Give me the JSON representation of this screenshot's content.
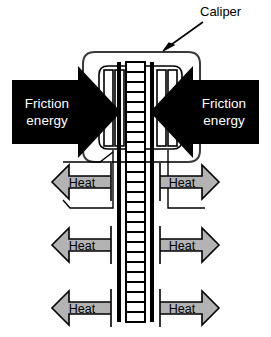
{
  "figure": {
    "background_color": "#ffffff"
  },
  "annotations": {
    "caliper": {
      "label": "Caliper",
      "leader_from": [
        201,
        22
      ],
      "leader_to": [
        163,
        49
      ],
      "text_color": "#000000"
    }
  },
  "friction_arrows": [
    {
      "id": "friction-left",
      "label_line1": "Friction",
      "label_line2": "energy",
      "direction": "right",
      "fill": "#000000",
      "text_color": "#ffffff"
    },
    {
      "id": "friction-right",
      "label_line1": "Friction",
      "label_line2": "energy",
      "direction": "left",
      "fill": "#000000",
      "text_color": "#ffffff"
    }
  ],
  "heat_arrows": [
    {
      "id": "heat-left-1",
      "label": "Heat",
      "direction": "left",
      "row": 1,
      "fill": "#b3b3b3",
      "stroke": "#000000",
      "text_color": "#000000"
    },
    {
      "id": "heat-right-1",
      "label": "Heat",
      "direction": "right",
      "row": 1,
      "fill": "#b3b3b3",
      "stroke": "#000000",
      "text_color": "#000000"
    },
    {
      "id": "heat-left-2",
      "label": "Heat",
      "direction": "left",
      "row": 2,
      "fill": "#b3b3b3",
      "stroke": "#000000",
      "text_color": "#000000"
    },
    {
      "id": "heat-right-2",
      "label": "Heat",
      "direction": "right",
      "row": 2,
      "fill": "#b3b3b3",
      "stroke": "#000000",
      "text_color": "#000000"
    },
    {
      "id": "heat-left-3",
      "label": "Heat",
      "direction": "left",
      "row": 3,
      "fill": "#b3b3b3",
      "stroke": "#000000",
      "text_color": "#000000"
    },
    {
      "id": "heat-right-3",
      "label": "Heat",
      "direction": "right",
      "row": 3,
      "fill": "#b3b3b3",
      "stroke": "#000000",
      "text_color": "#000000"
    }
  ],
  "components": {
    "rotor": {
      "name": "vented-brake-rotor",
      "fill": "#ffffff",
      "stroke": "#000000",
      "vent_count": 26
    },
    "caliper_body": {
      "name": "caliper-housing",
      "fill": "#ffffff",
      "stroke": "#333333"
    },
    "pads": {
      "name": "brake-pads",
      "fill": "#ffffff",
      "stroke": "#000000"
    }
  }
}
